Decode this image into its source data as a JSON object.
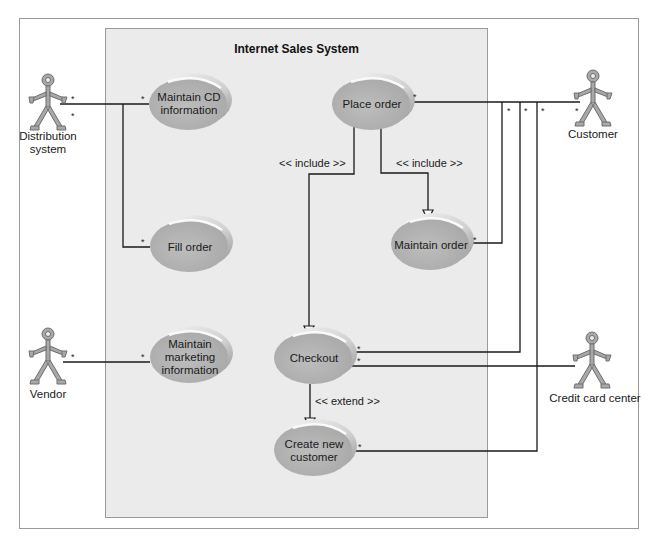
{
  "diagram": {
    "type": "UML use case diagram",
    "system_title": "Internet Sales System",
    "colors": {
      "use_case_fill": "#b5b5b5",
      "use_case_highlight": "#f4f4f4",
      "system_fill": "#ebebeb",
      "actor_fill": "#a8a8a8",
      "line": "#1a1a1a"
    },
    "actors": [
      {
        "id": "distribution",
        "label": "Distribution system"
      },
      {
        "id": "customer",
        "label": "Customer"
      },
      {
        "id": "vendor",
        "label": "Vendor"
      },
      {
        "id": "credit",
        "label": "Credit card center"
      }
    ],
    "use_cases": [
      {
        "id": "maintain_cd",
        "label": "Maintain CD information"
      },
      {
        "id": "place_order",
        "label": "Place order"
      },
      {
        "id": "fill_order",
        "label": "Fill order"
      },
      {
        "id": "maintain_order",
        "label": "Maintain order"
      },
      {
        "id": "maintain_marketing",
        "label": "Maintain marketing information"
      },
      {
        "id": "checkout",
        "label": "Checkout"
      },
      {
        "id": "create_customer",
        "label": "Create new customer"
      }
    ],
    "relationships": [
      {
        "type": "include",
        "label": "<< include >>",
        "from": "place_order",
        "to": "checkout"
      },
      {
        "type": "include",
        "label": "<< include >>",
        "from": "place_order",
        "to": "maintain_order"
      },
      {
        "type": "extend",
        "label": "<< extend >>",
        "from": "checkout",
        "to": "create_customer"
      }
    ],
    "associations": [
      {
        "actor": "distribution",
        "use_case": "maintain_cd",
        "multiplicity": [
          "*",
          "*"
        ]
      },
      {
        "actor": "distribution",
        "use_case": "fill_order",
        "multiplicity": [
          "*",
          "*"
        ]
      },
      {
        "actor": "customer",
        "use_case": "place_order",
        "multiplicity": [
          "*",
          "*"
        ]
      },
      {
        "actor": "customer",
        "use_case": "maintain_order",
        "multiplicity": [
          "*",
          "*"
        ]
      },
      {
        "actor": "customer",
        "use_case": "checkout",
        "multiplicity": [
          "*",
          "*"
        ]
      },
      {
        "actor": "customer",
        "use_case": "create_customer",
        "multiplicity": [
          "*",
          "*"
        ]
      },
      {
        "actor": "vendor",
        "use_case": "maintain_marketing",
        "multiplicity": [
          "*",
          "*"
        ]
      },
      {
        "actor": "credit",
        "use_case": "checkout",
        "multiplicity": [
          "*"
        ]
      }
    ],
    "multiplicity_symbol": "*"
  }
}
